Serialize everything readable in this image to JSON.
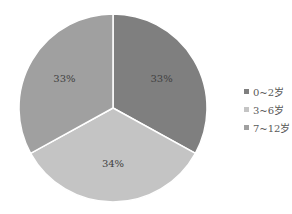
{
  "chart_data": {
    "type": "pie",
    "title": "",
    "categories": [
      "0~2岁",
      "3~6岁",
      "7~12岁"
    ],
    "values": [
      33,
      34,
      33
    ],
    "labels": [
      "33%",
      "34%",
      "33%"
    ],
    "colors": [
      "#7f7f7f",
      "#c4c4c4",
      "#a0a0a0"
    ],
    "legend_position": "right",
    "start_angle_deg": 0,
    "direction": "clockwise"
  },
  "legend": {
    "items": [
      {
        "label": "0~2岁",
        "color": "#7f7f7f"
      },
      {
        "label": "3~6岁",
        "color": "#c4c4c4"
      },
      {
        "label": "7~12岁",
        "color": "#a0a0a0"
      }
    ]
  }
}
